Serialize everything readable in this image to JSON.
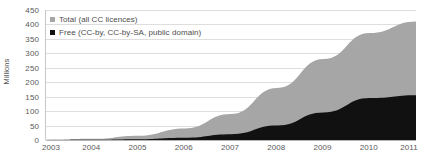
{
  "chart_data": {
    "type": "area",
    "title": "",
    "subtitle": "",
    "xlabel": "",
    "ylabel": "Millions",
    "categories": [
      "2003",
      "2004",
      "2005",
      "2006",
      "2007",
      "2008",
      "2009",
      "2010",
      "2011"
    ],
    "x": [
      2003,
      2004,
      2005,
      2006,
      2007,
      2008,
      2009,
      2010,
      2011
    ],
    "xlim": [
      2003,
      2011
    ],
    "ylim": [
      0,
      450
    ],
    "y_ticks": [
      0,
      50,
      100,
      150,
      200,
      250,
      300,
      350,
      400,
      450
    ],
    "y_tick_labels": [
      "0",
      "50",
      "100",
      "150",
      "200",
      "250",
      "300",
      "350",
      "400",
      "450"
    ],
    "grid": true,
    "grid_axis": "y",
    "stacked": false,
    "legend_position": "top-left",
    "series": [
      {
        "name": "Total (all CC licences)",
        "color": "#a6a6a6",
        "values": [
          1,
          4,
          15,
          40,
          90,
          180,
          280,
          370,
          410
        ]
      },
      {
        "name": "Free (CC-by, CC-by-SA, public domain)",
        "color": "#111111",
        "values": [
          0,
          1,
          3,
          8,
          20,
          50,
          95,
          145,
          155
        ]
      }
    ]
  },
  "legend": {
    "entries": [
      {
        "label": "Total (all CC licences)",
        "marker": "square-gray"
      },
      {
        "label": "Free (CC-by, CC-by-SA, public domain)",
        "marker": "square-black"
      }
    ]
  },
  "axes": {
    "y_title": "Millions"
  },
  "colors": {
    "total_fill": "#a6a6a6",
    "free_fill": "#111111",
    "gridline": "#dedede",
    "axis_line": "#b4b4b4",
    "tick_text": "#595959",
    "background": "#ffffff"
  }
}
